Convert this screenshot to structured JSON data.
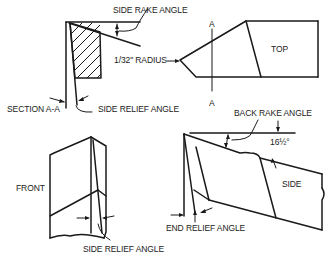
{
  "diagram": {
    "views": {
      "section": {
        "label": "SECTION A-A"
      },
      "top": {
        "label": "TOP",
        "section_marker_top": "A",
        "section_marker_bottom": "A"
      },
      "front": {
        "label": "FRONT"
      },
      "side": {
        "label": "SIDE"
      }
    },
    "annotations": {
      "side_rake_angle": "SIDE RAKE ANGLE",
      "radius": "1/32\" RADIUS",
      "side_relief_angle_section": "SIDE RELIEF ANGLE",
      "side_relief_angle_front": "SIDE RELIEF ANGLE",
      "back_rake_angle": "BACK RAKE ANGLE",
      "back_rake_value": "16½°",
      "end_relief_angle": "END RELIEF ANGLE"
    },
    "colors": {
      "line": "#1a1a1a",
      "text": "#222222",
      "background": "#ffffff"
    }
  }
}
